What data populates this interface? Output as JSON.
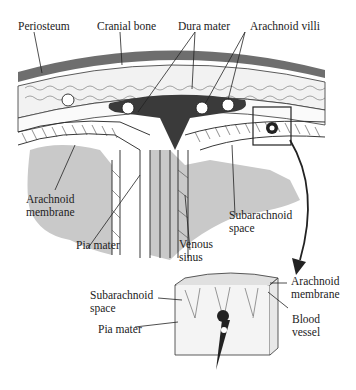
{
  "diagram": {
    "labels": {
      "periosteum": "Periosteum",
      "cranial_bone": "Cranial bone",
      "dura_mater": "Dura mater",
      "arachnoid_villi": "Arachnoid villi",
      "arachnoid_membrane_l1": "Arachnoid",
      "arachnoid_membrane_l2": "membrane",
      "pia_mater": "Pia mater",
      "venous_sinus_l1": "Venous",
      "venous_sinus_l2": "sinus",
      "subarachnoid_space_l1": "Subarachnoid",
      "subarachnoid_space_l2": "space"
    },
    "inset_labels": {
      "subarachnoid_space_l1": "Subarachnoid",
      "subarachnoid_space_l2": "space",
      "pia_mater": "Pia mater",
      "arachnoid_membrane_l1": "Arachnoid",
      "arachnoid_membrane_l2": "membrane",
      "blood_vessel_l1": "Blood",
      "blood_vessel_l2": "vessel"
    },
    "colors": {
      "periosteum": "#6e6e6e",
      "venous_sinus": "#3a3a3a",
      "brain_tissue": "#c8c8c8",
      "line": "#222222"
    }
  }
}
